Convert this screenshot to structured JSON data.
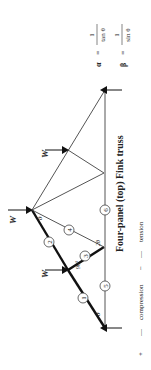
{
  "title": "Four-panel (top) Fink truss",
  "formulas": {
    "alpha": {
      "lhs": "α",
      "eq": "=",
      "num": "1",
      "den": "tan θ"
    },
    "beta": {
      "lhs": "β",
      "eq": "=",
      "num": "1",
      "den": "sin θ"
    }
  },
  "legend": {
    "compression": {
      "symbol": "+",
      "dash": "—",
      "label": "compression"
    },
    "tension": {
      "symbol": "−",
      "dash": "—",
      "label": "tension"
    }
  },
  "loads": [
    {
      "label": "W"
    },
    {
      "label": "W"
    },
    {
      "label": "W"
    }
  ],
  "members": [
    "1",
    "2",
    "3",
    "4",
    "5",
    "6"
  ],
  "angles": {
    "theta_support": "θ",
    "theta_apex": "θ",
    "right_angle": "90°",
    "two_theta": "2θ"
  }
}
